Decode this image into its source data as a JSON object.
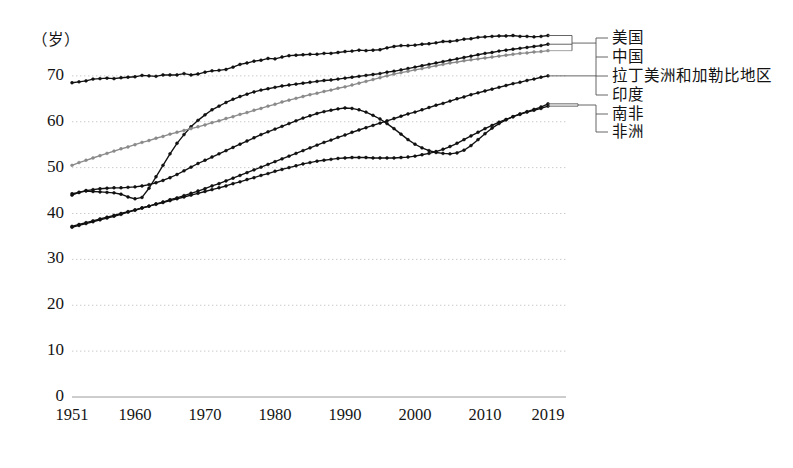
{
  "chart_data": {
    "type": "line",
    "title": "",
    "subtitle": "",
    "xlabel": "",
    "ylabel": "（岁）",
    "unit_label": "（岁）",
    "grid": true,
    "legend_position": "right-bracket-callouts",
    "xlim": [
      1951,
      2019
    ],
    "ylim": [
      0,
      80
    ],
    "yticks": [
      "0",
      "10",
      "20",
      "30",
      "40",
      "50",
      "60",
      "70"
    ],
    "ytick_values": [
      0,
      10,
      20,
      30,
      40,
      50,
      60,
      70
    ],
    "xticks": [
      "1951",
      "1960",
      "1970",
      "1980",
      "1990",
      "2000",
      "2010",
      "2019"
    ],
    "xtick_values": [
      1951,
      1960,
      1970,
      1980,
      1990,
      2000,
      2010,
      2019
    ],
    "x": [
      1951,
      1952,
      1953,
      1954,
      1955,
      1956,
      1957,
      1958,
      1959,
      1960,
      1961,
      1962,
      1963,
      1964,
      1965,
      1966,
      1967,
      1968,
      1969,
      1970,
      1971,
      1972,
      1973,
      1974,
      1975,
      1976,
      1977,
      1978,
      1979,
      1980,
      1981,
      1982,
      1983,
      1984,
      1985,
      1986,
      1987,
      1988,
      1989,
      1990,
      1991,
      1992,
      1993,
      1994,
      1995,
      1996,
      1997,
      1998,
      1999,
      2000,
      2001,
      2002,
      2003,
      2004,
      2005,
      2006,
      2007,
      2008,
      2009,
      2010,
      2011,
      2012,
      2013,
      2014,
      2015,
      2016,
      2017,
      2018,
      2019
    ],
    "series": [
      {
        "name": "美国",
        "color": "#111111",
        "marker": "dot",
        "values": [
          68.5,
          68.7,
          68.9,
          69.3,
          69.4,
          69.5,
          69.4,
          69.6,
          69.7,
          69.8,
          70.1,
          70.0,
          69.9,
          70.2,
          70.2,
          70.2,
          70.5,
          70.2,
          70.4,
          70.8,
          71.1,
          71.2,
          71.4,
          71.9,
          72.5,
          72.8,
          73.2,
          73.4,
          73.8,
          73.7,
          74.1,
          74.4,
          74.5,
          74.6,
          74.7,
          74.7,
          74.9,
          74.9,
          75.1,
          75.3,
          75.4,
          75.6,
          75.5,
          75.6,
          75.7,
          76.1,
          76.4,
          76.6,
          76.6,
          76.7,
          76.9,
          77.0,
          77.2,
          77.5,
          77.5,
          77.7,
          78.0,
          78.1,
          78.4,
          78.5,
          78.6,
          78.7,
          78.7,
          78.8,
          78.6,
          78.6,
          78.5,
          78.6,
          78.8
        ]
      },
      {
        "name": "中国",
        "color": "#111111",
        "marker": "dot",
        "values": [
          44.0,
          44.6,
          44.9,
          44.8,
          44.7,
          44.6,
          44.5,
          44.2,
          43.6,
          43.2,
          43.5,
          45.5,
          48.0,
          50.5,
          53.0,
          55.3,
          57.2,
          58.9,
          60.3,
          61.5,
          62.6,
          63.4,
          64.2,
          64.9,
          65.5,
          66.0,
          66.5,
          66.9,
          67.2,
          67.5,
          67.8,
          68.0,
          68.2,
          68.4,
          68.6,
          68.8,
          69.0,
          69.1,
          69.3,
          69.5,
          69.7,
          69.9,
          70.1,
          70.3,
          70.5,
          70.8,
          71.0,
          71.3,
          71.6,
          71.9,
          72.2,
          72.5,
          72.8,
          73.1,
          73.4,
          73.7,
          74.0,
          74.3,
          74.6,
          74.9,
          75.1,
          75.4,
          75.6,
          75.8,
          76.0,
          76.2,
          76.4,
          76.6,
          76.9
        ]
      },
      {
        "name": "拉丁美洲和加勒比地区",
        "color": "#8a8a8a",
        "marker": "dot",
        "values": [
          50.5,
          51.1,
          51.6,
          52.1,
          52.6,
          53.1,
          53.6,
          54.1,
          54.5,
          55.0,
          55.5,
          55.9,
          56.4,
          56.8,
          57.3,
          57.7,
          58.1,
          58.5,
          58.9,
          59.3,
          59.8,
          60.2,
          60.7,
          61.1,
          61.6,
          62.0,
          62.5,
          62.9,
          63.4,
          63.8,
          64.3,
          64.7,
          65.1,
          65.5,
          65.9,
          66.2,
          66.6,
          66.9,
          67.3,
          67.6,
          68.0,
          68.4,
          68.8,
          69.2,
          69.6,
          70.0,
          70.4,
          70.7,
          71.0,
          71.3,
          71.6,
          71.9,
          72.2,
          72.5,
          72.8,
          73.0,
          73.3,
          73.5,
          73.7,
          73.9,
          74.1,
          74.3,
          74.5,
          74.7,
          74.9,
          75.0,
          75.2,
          75.3,
          75.5
        ]
      },
      {
        "name": "印度",
        "color": "#111111",
        "marker": "dot",
        "values": [
          37.0,
          37.4,
          37.8,
          38.2,
          38.6,
          39.0,
          39.4,
          39.8,
          40.3,
          40.7,
          41.2,
          41.6,
          42.1,
          42.5,
          43.0,
          43.4,
          43.9,
          44.4,
          44.9,
          45.4,
          46.0,
          46.5,
          47.1,
          47.7,
          48.3,
          48.9,
          49.5,
          50.1,
          50.7,
          51.3,
          51.9,
          52.5,
          53.1,
          53.7,
          54.3,
          54.9,
          55.5,
          56.0,
          56.6,
          57.1,
          57.7,
          58.2,
          58.7,
          59.2,
          59.7,
          60.2,
          60.7,
          61.2,
          61.7,
          62.1,
          62.6,
          63.1,
          63.6,
          64.0,
          64.5,
          65.0,
          65.4,
          65.9,
          66.3,
          66.7,
          67.1,
          67.5,
          67.9,
          68.3,
          68.6,
          69.0,
          69.3,
          69.7,
          70.0
        ]
      },
      {
        "name": "南非",
        "color": "#111111",
        "marker": "dot",
        "values": [
          44.3,
          44.6,
          45.0,
          45.2,
          45.4,
          45.5,
          45.6,
          45.6,
          45.7,
          45.8,
          46.0,
          46.3,
          46.7,
          47.2,
          47.8,
          48.5,
          49.3,
          50.1,
          50.9,
          51.6,
          52.3,
          53.0,
          53.7,
          54.4,
          55.1,
          55.8,
          56.5,
          57.2,
          57.8,
          58.4,
          59.0,
          59.6,
          60.2,
          60.8,
          61.3,
          61.8,
          62.2,
          62.5,
          62.8,
          63.0,
          62.9,
          62.6,
          62.1,
          61.4,
          60.6,
          59.6,
          58.5,
          57.3,
          56.1,
          55.1,
          54.3,
          53.7,
          53.3,
          53.1,
          53.0,
          53.2,
          53.8,
          54.8,
          56.1,
          57.4,
          58.6,
          59.6,
          60.4,
          61.1,
          61.7,
          62.2,
          62.7,
          63.2,
          63.9
        ]
      },
      {
        "name": "非洲",
        "color": "#111111",
        "marker": "dot",
        "values": [
          37.2,
          37.6,
          38.0,
          38.4,
          38.8,
          39.2,
          39.6,
          40.0,
          40.4,
          40.8,
          41.2,
          41.6,
          42.0,
          42.4,
          42.8,
          43.2,
          43.6,
          44.0,
          44.4,
          44.8,
          45.2,
          45.6,
          46.0,
          46.5,
          46.9,
          47.4,
          47.8,
          48.3,
          48.7,
          49.2,
          49.6,
          50.0,
          50.4,
          50.8,
          51.1,
          51.4,
          51.6,
          51.8,
          52.0,
          52.1,
          52.2,
          52.2,
          52.2,
          52.1,
          52.1,
          52.1,
          52.1,
          52.2,
          52.3,
          52.5,
          52.8,
          53.1,
          53.5,
          54.0,
          54.6,
          55.3,
          56.1,
          56.9,
          57.7,
          58.5,
          59.2,
          59.9,
          60.5,
          61.1,
          61.6,
          62.1,
          62.5,
          62.9,
          63.4
        ]
      }
    ]
  },
  "legend": {
    "items": [
      {
        "label": "美国"
      },
      {
        "label": "中国"
      },
      {
        "label": "拉丁美洲和加勒比地区"
      },
      {
        "label": "印度"
      },
      {
        "label": "南非"
      },
      {
        "label": "非洲"
      }
    ]
  }
}
